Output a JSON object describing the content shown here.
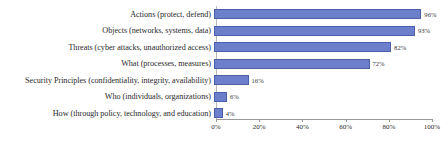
{
  "chart_data": {
    "type": "bar",
    "orientation": "horizontal",
    "title": "",
    "xlabel": "",
    "ylabel": "",
    "xlim": [
      0,
      100
    ],
    "grid": false,
    "legend": false,
    "categories": [
      "Actions (protect, defend)",
      "Objects (networks, systems, data)",
      "Threats (cyber attacks, unauthorized access)",
      "What (processes, measures)",
      "Security Principles (confidentiality, integrity, availability)",
      "Who (individuals, organizations)",
      "How (through policy, technology, and education)"
    ],
    "values": [
      96,
      93,
      82,
      72,
      16,
      6,
      4
    ],
    "data_labels": [
      "96%",
      "93%",
      "82%",
      "72%",
      "16%",
      "6%",
      "4%"
    ],
    "xticks": [
      0,
      20,
      40,
      60,
      80,
      100
    ],
    "xtick_labels": [
      "0%",
      "20%",
      "40%",
      "60%",
      "80%",
      "100%"
    ],
    "colors": {
      "bar_fill": "#6B7FCB",
      "bar_border": "#4c5fa8",
      "text": "#2b2b2b",
      "axis": "#9a9a9a",
      "background": "#ffffff"
    }
  }
}
